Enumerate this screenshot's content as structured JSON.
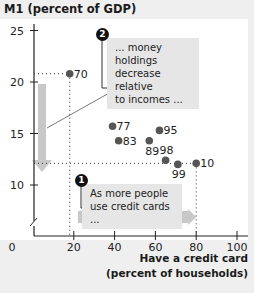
{
  "chart_data": {
    "type": "scatter",
    "title": "",
    "ylabel": "M1 (percent of GDP)",
    "xlabel": "Have a credit card (percent of households)",
    "xlim": [
      0,
      100
    ],
    "ylim": [
      10,
      25
    ],
    "y_axis_break": true,
    "x_ticks": [
      0,
      20,
      40,
      60,
      80,
      100
    ],
    "y_ticks": [
      10,
      15,
      20,
      25
    ],
    "grid": false,
    "points": [
      {
        "label": "70",
        "x": 18,
        "y": 20.8
      },
      {
        "label": "77",
        "x": 39,
        "y": 15.7
      },
      {
        "label": "83",
        "x": 42,
        "y": 14.3
      },
      {
        "label": "89",
        "x": 57,
        "y": 14.3
      },
      {
        "label": "95",
        "x": 62,
        "y": 15.3
      },
      {
        "label": "98",
        "x": 65,
        "y": 12.4
      },
      {
        "label": "99",
        "x": 71,
        "y": 12.0
      },
      {
        "label": "10",
        "x": 80,
        "y": 12.1
      }
    ],
    "annotations": [
      {
        "number": "1",
        "text": "As more people use credit cards ..."
      },
      {
        "number": "2",
        "text": "... money holdings decrease relative to incomes ..."
      }
    ]
  },
  "labels": {
    "ylabel": "M1 (percent of GDP)",
    "xlabel_line1": "Have a credit card",
    "xlabel_line2": "(percent of households)",
    "note1_badge": "1",
    "note1_line1": "As more people",
    "note1_line2": "use credit cards ...",
    "note2_badge": "2",
    "note2_line1": "... money holdings",
    "note2_line2": "decrease relative",
    "note2_line3": "to incomes ..."
  },
  "colors": {
    "point": "#555555",
    "arrow": "#c8c8c8",
    "note_bg": "#e6e6e6"
  }
}
